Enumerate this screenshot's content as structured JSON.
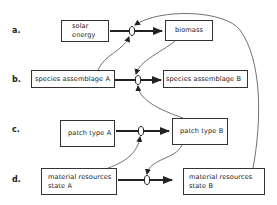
{
  "diagram": {
    "rows": [
      {
        "label": "a.",
        "from": {
          "lines": [
            "solar",
            "energy"
          ]
        },
        "to": {
          "lines": [
            "biomass"
          ]
        }
      },
      {
        "label": "b.",
        "from": {
          "lines": [
            "species assemblage A"
          ]
        },
        "to": {
          "lines": [
            "species assemblage B"
          ]
        }
      },
      {
        "label": "c.",
        "from": {
          "lines": [
            "patch type A"
          ]
        },
        "to": {
          "lines": [
            "patch type B"
          ]
        }
      },
      {
        "label": "d.",
        "from": {
          "lines": [
            "material resources",
            "state A"
          ]
        },
        "to": {
          "lines": [
            "material resources",
            "state B"
          ]
        }
      }
    ],
    "connections": [
      {
        "from": "solar energy",
        "to": "biomass",
        "type": "flow"
      },
      {
        "from": "species assemblage A",
        "to": "species assemblage B",
        "type": "flow"
      },
      {
        "from": "patch type A",
        "to": "patch type B",
        "type": "flow"
      },
      {
        "from": "material resources state A",
        "to": "material resources state B",
        "type": "flow"
      },
      {
        "from": "species assemblage A",
        "to": "valve a",
        "type": "influence"
      },
      {
        "from": "biomass",
        "to": "valve b",
        "type": "influence"
      },
      {
        "from": "patch type B",
        "to": "valve b",
        "type": "influence"
      },
      {
        "from": "material resources state A",
        "to": "valve c",
        "type": "influence"
      },
      {
        "from": "patch type B",
        "to": "valve d",
        "type": "influence"
      },
      {
        "from": "material resources state B",
        "to": "valve a",
        "type": "influence"
      }
    ],
    "colors": {
      "stroke": "#222222",
      "background": "#ffffff"
    }
  }
}
